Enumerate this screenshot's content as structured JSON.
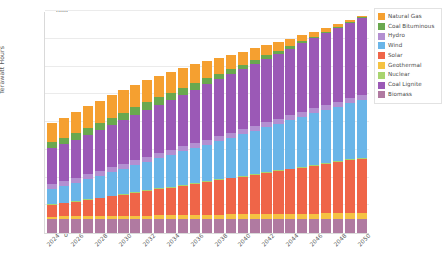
{
  "chart_data": {
    "type": "bar",
    "stacked": true,
    "title": "",
    "xlabel": "",
    "ylabel": "Terawatt Hours",
    "ylim": [
      0,
      800
    ],
    "ytick_values": [
      0,
      100,
      200,
      300,
      400,
      500,
      600,
      700,
      800
    ],
    "ytick_labels": [
      "0",
      "100",
      "200",
      "300",
      "400",
      "500",
      "600",
      "700",
      "800"
    ],
    "grid": true,
    "legend_position": "right",
    "categories": [
      "2024",
      "2025",
      "2026",
      "2027",
      "2028",
      "2029",
      "2030",
      "2031",
      "2032",
      "2033",
      "2034",
      "2035",
      "2036",
      "2037",
      "2038",
      "2039",
      "2040",
      "2041",
      "2042",
      "2043",
      "2044",
      "2045",
      "2046",
      "2047",
      "2048",
      "2049",
      "2050"
    ],
    "xtick_labels": [
      "2024",
      "",
      "2026",
      "",
      "2028",
      "",
      "2030",
      "",
      "2032",
      "",
      "2034",
      "",
      "2036",
      "",
      "2038",
      "",
      "2040",
      "",
      "2042",
      "",
      "2044",
      "",
      "2046",
      "",
      "2048",
      "",
      "2050"
    ],
    "series": [
      {
        "name": "Biomass",
        "color": "#b07aa1",
        "values": [
          52,
          52,
          52,
          52,
          52,
          52,
          52,
          52,
          52,
          52,
          52,
          52,
          52,
          52,
          52,
          52,
          52,
          52,
          52,
          52,
          52,
          52,
          52,
          52,
          52,
          52,
          52
        ]
      },
      {
        "name": "Geothermal",
        "color": "#f5c242",
        "values": [
          7,
          8,
          8,
          9,
          9,
          10,
          10,
          11,
          11,
          12,
          12,
          13,
          13,
          14,
          14,
          15,
          15,
          16,
          16,
          17,
          17,
          18,
          18,
          19,
          19,
          20,
          20
        ]
      },
      {
        "name": "Solar",
        "color": "#ef6548",
        "values": [
          42,
          47,
          52,
          58,
          64,
          70,
          76,
          82,
          88,
          94,
          100,
          106,
          112,
          118,
          124,
          130,
          136,
          142,
          148,
          154,
          160,
          166,
          172,
          178,
          184,
          190,
          196
        ]
      },
      {
        "name": "Nuclear",
        "color": "#a8d46f",
        "values": [
          3,
          3,
          3,
          3,
          3,
          3,
          3,
          3,
          3,
          3,
          3,
          3,
          3,
          3,
          3,
          3,
          3,
          3,
          3,
          3,
          3,
          3,
          3,
          3,
          3,
          3,
          3
        ]
      },
      {
        "name": "Wind",
        "color": "#6ab5e8",
        "values": [
          55,
          60,
          66,
          72,
          78,
          84,
          90,
          96,
          102,
          108,
          114,
          120,
          126,
          132,
          138,
          144,
          150,
          156,
          162,
          168,
          174,
          180,
          186,
          192,
          198,
          204,
          210
        ]
      },
      {
        "name": "Hydro",
        "color": "#b38fd1",
        "values": [
          18,
          18,
          18,
          18,
          18,
          18,
          18,
          18,
          18,
          18,
          18,
          18,
          18,
          18,
          18,
          18,
          18,
          18,
          18,
          18,
          18,
          18,
          18,
          18,
          18,
          18,
          18
        ]
      },
      {
        "name": "Coal Lignite",
        "color": "#9b59b6",
        "values": [
          128,
          132,
          137,
          142,
          147,
          152,
          157,
          163,
          169,
          175,
          181,
          187,
          193,
          199,
          205,
          211,
          217,
          223,
          229,
          235,
          241,
          247,
          253,
          259,
          265,
          271,
          277
        ]
      },
      {
        "name": "Coal Bituminous",
        "color": "#6aa84f",
        "values": [
          22,
          23,
          24,
          25,
          26,
          27,
          28,
          28,
          28,
          27,
          26,
          25,
          24,
          22,
          20,
          18,
          16,
          14,
          12,
          10,
          8,
          7,
          6,
          5,
          4,
          3,
          2
        ]
      },
      {
        "name": "Natural Gas",
        "color": "#f5a030",
        "values": [
          68,
          72,
          75,
          78,
          80,
          81,
          82,
          81,
          79,
          77,
          74,
          71,
          67,
          62,
          57,
          52,
          47,
          42,
          37,
          32,
          27,
          22,
          18,
          14,
          11,
          8,
          6
        ]
      }
    ]
  },
  "legend": {
    "items": [
      {
        "label": "Natural Gas",
        "color": "#f5a030"
      },
      {
        "label": "Coal Bituminous",
        "color": "#6aa84f"
      },
      {
        "label": "Hydro",
        "color": "#b38fd1"
      },
      {
        "label": "Wind",
        "color": "#6ab5e8"
      },
      {
        "label": "Solar",
        "color": "#ef6548"
      },
      {
        "label": "Geothermal",
        "color": "#f5c242"
      },
      {
        "label": "Nuclear",
        "color": "#a8d46f"
      },
      {
        "label": "Coal Lignite",
        "color": "#9b59b6"
      },
      {
        "label": "Biomass",
        "color": "#b07aa1"
      }
    ]
  }
}
